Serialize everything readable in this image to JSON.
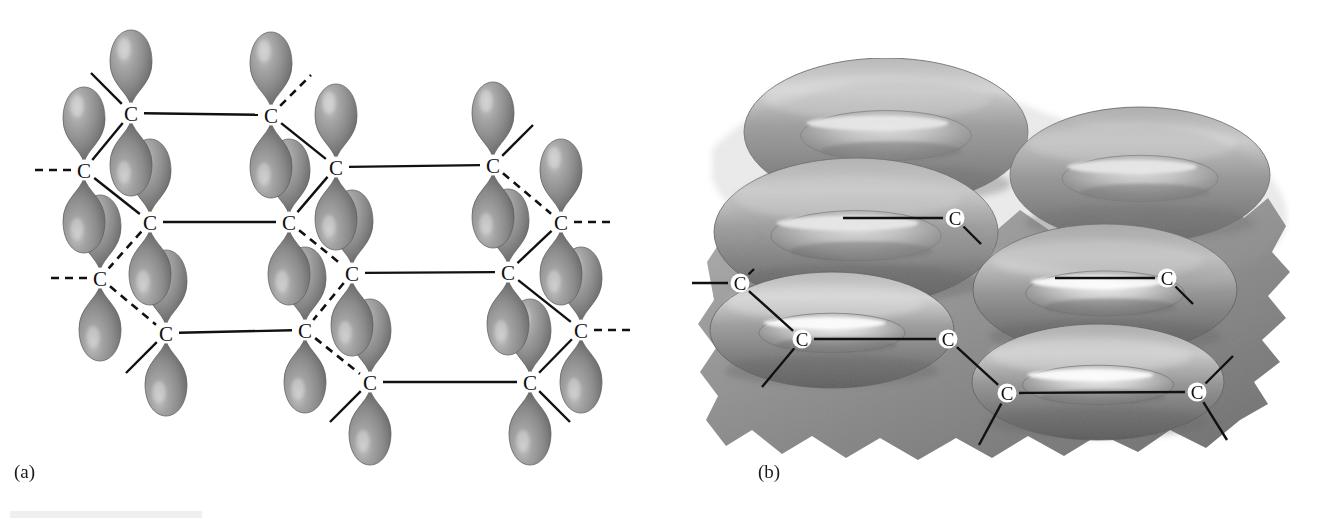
{
  "figure": {
    "kind": "chemistry-structure-diagram",
    "background_color": "#ffffff",
    "ink_color": "#111111",
    "orbital_colors": {
      "highlight": "#c2c2c2",
      "body": "#8d8d8d",
      "shadow": "#5f5f5f",
      "edge": "#4a4a4a"
    },
    "cloud_colors": {
      "highlight": "#e8e8e8",
      "body": "#9a9a9a",
      "shadow": "#6b6b6b",
      "deep": "#565656"
    }
  },
  "panels": [
    {
      "id": "panel-a",
      "label": "(a)",
      "label_x": 14,
      "label_y": 478,
      "description": "Hexagonal carbon sheet with unhybridized p orbitals shown as separate lobes above and below each carbon atom",
      "atom_symbol": "C",
      "atoms": [
        {
          "id": "a1",
          "x": 131,
          "y": 113,
          "lobes": "both"
        },
        {
          "id": "a2",
          "x": 271,
          "y": 115,
          "lobes": "both"
        },
        {
          "id": "a3",
          "x": 84,
          "y": 170,
          "lobes": "both"
        },
        {
          "id": "a4",
          "x": 336,
          "y": 167,
          "lobes": "both"
        },
        {
          "id": "a5",
          "x": 493,
          "y": 165,
          "lobes": "both"
        },
        {
          "id": "a6",
          "x": 150,
          "y": 222,
          "lobes": "both"
        },
        {
          "id": "a7",
          "x": 289,
          "y": 222,
          "lobes": "both"
        },
        {
          "id": "a8",
          "x": 561,
          "y": 222,
          "lobes": "both"
        },
        {
          "id": "a9",
          "x": 100,
          "y": 278,
          "lobes": "both"
        },
        {
          "id": "a10",
          "x": 352,
          "y": 273,
          "lobes": "both"
        },
        {
          "id": "a11",
          "x": 508,
          "y": 272,
          "lobes": "both"
        },
        {
          "id": "a12",
          "x": 166,
          "y": 333,
          "lobes": "both"
        },
        {
          "id": "a13",
          "x": 305,
          "y": 330,
          "lobes": "both"
        },
        {
          "id": "a14",
          "x": 581,
          "y": 330,
          "lobes": "both"
        },
        {
          "id": "a15",
          "x": 370,
          "y": 382,
          "lobes": "both"
        },
        {
          "id": "a16",
          "x": 530,
          "y": 382,
          "lobes": "both"
        }
      ],
      "bonds": [
        {
          "from": "a1",
          "to": "a2",
          "style": "solid"
        },
        {
          "from": "a3",
          "to": "a1",
          "style": "solid"
        },
        {
          "from": "a3",
          "to": "a6",
          "style": "solid"
        },
        {
          "from": "a2",
          "to": "a4",
          "style": "solid"
        },
        {
          "from": "a6",
          "to": "a7",
          "style": "solid"
        },
        {
          "from": "a4",
          "to": "a5",
          "style": "solid"
        },
        {
          "from": "a7",
          "to": "a4",
          "style": "solid"
        },
        {
          "from": "a6",
          "to": "a9",
          "style": "dashed"
        },
        {
          "from": "a9",
          "to": "a12",
          "style": "dashed"
        },
        {
          "from": "a7",
          "to": "a10",
          "style": "dashed"
        },
        {
          "from": "a10",
          "to": "a11",
          "style": "solid"
        },
        {
          "from": "a5",
          "to": "a8",
          "style": "dashed"
        },
        {
          "from": "a8",
          "to": "a11",
          "style": "solid"
        },
        {
          "from": "a12",
          "to": "a13",
          "style": "solid"
        },
        {
          "from": "a10",
          "to": "a13",
          "style": "dashed"
        },
        {
          "from": "a13",
          "to": "a15",
          "style": "dashed"
        },
        {
          "from": "a15",
          "to": "a16",
          "style": "solid"
        },
        {
          "from": "a11",
          "to": "a14",
          "style": "solid"
        },
        {
          "from": "a16",
          "to": "a14",
          "style": "solid"
        }
      ],
      "stub_bonds": [
        {
          "at": "a1",
          "dx": -40,
          "dy": -40,
          "style": "solid"
        },
        {
          "at": "a2",
          "dx": 40,
          "dy": -40,
          "style": "dashed"
        },
        {
          "at": "a3",
          "dx": -52,
          "dy": 0,
          "style": "dashed"
        },
        {
          "at": "a5",
          "dx": 40,
          "dy": -40,
          "style": "solid"
        },
        {
          "at": "a9",
          "dx": -52,
          "dy": 0,
          "style": "dashed"
        },
        {
          "at": "a8",
          "dx": 52,
          "dy": 0,
          "style": "dashed"
        },
        {
          "at": "a12",
          "dx": -40,
          "dy": 40,
          "style": "solid"
        },
        {
          "at": "a14",
          "dx": 52,
          "dy": 0,
          "style": "dashed"
        },
        {
          "at": "a15",
          "dx": -40,
          "dy": 40,
          "style": "solid"
        },
        {
          "at": "a16",
          "dx": 40,
          "dy": 40,
          "style": "solid"
        }
      ]
    },
    {
      "id": "panel-b",
      "label": "(b)",
      "label_x": 758,
      "label_y": 478,
      "description": "Same sheet with the p orbitals merged into continuous doughnut-shaped pi electron clouds above and below the plane of carbon atoms",
      "atom_symbol": "C",
      "atoms": [
        {
          "id": "b1",
          "x": 955,
          "y": 218,
          "context": "embedded-in-cloud"
        },
        {
          "id": "b2",
          "x": 1167,
          "y": 278,
          "context": "embedded-in-cloud"
        },
        {
          "id": "b3",
          "x": 740,
          "y": 283,
          "context": "front-edge"
        },
        {
          "id": "b4",
          "x": 802,
          "y": 339,
          "context": "front-edge"
        },
        {
          "id": "b5",
          "x": 948,
          "y": 339,
          "context": "front-edge"
        },
        {
          "id": "b6",
          "x": 1007,
          "y": 393,
          "context": "front-edge"
        },
        {
          "id": "b7",
          "x": 1197,
          "y": 392,
          "context": "front-edge"
        }
      ],
      "bonds": [
        {
          "from": "b3",
          "to": "b4",
          "style": "solid"
        },
        {
          "from": "b4",
          "to": "b5",
          "style": "solid"
        },
        {
          "from": "b5",
          "to": "b6",
          "style": "solid"
        },
        {
          "from": "b6",
          "to": "b7",
          "style": "solid"
        }
      ],
      "stub_bonds": [
        {
          "at": "b1",
          "dx": -112,
          "dy": 0,
          "style": "solid"
        },
        {
          "at": "b1",
          "dx": 26,
          "dy": 26,
          "style": "solid"
        },
        {
          "at": "b2",
          "dx": -112,
          "dy": 0,
          "style": "solid"
        },
        {
          "at": "b2",
          "dx": 26,
          "dy": 26,
          "style": "solid"
        },
        {
          "at": "b3",
          "dx": -48,
          "dy": 0,
          "style": "solid"
        },
        {
          "at": "b3",
          "dx": 14,
          "dy": -14,
          "style": "solid"
        },
        {
          "at": "b4",
          "dx": -40,
          "dy": 48,
          "style": "solid"
        },
        {
          "at": "b6",
          "dx": -28,
          "dy": 52,
          "style": "solid"
        },
        {
          "at": "b7",
          "dx": 36,
          "dy": -36,
          "style": "solid"
        },
        {
          "at": "b7",
          "dx": 30,
          "dy": 48,
          "style": "solid"
        }
      ],
      "clouds": [
        {
          "id": "ring-upper-left",
          "cx": 886,
          "cy": 132,
          "rx": 142,
          "ry": 74,
          "layer": "top"
        },
        {
          "id": "ring-upper-right",
          "cx": 1140,
          "cy": 175,
          "rx": 130,
          "ry": 68,
          "layer": "top"
        },
        {
          "id": "ring-mid-left",
          "cx": 856,
          "cy": 232,
          "rx": 142,
          "ry": 74,
          "layer": "middle"
        },
        {
          "id": "ring-mid-right",
          "cx": 1105,
          "cy": 290,
          "rx": 132,
          "ry": 66,
          "layer": "middle"
        },
        {
          "id": "ring-lower-left",
          "cx": 832,
          "cy": 330,
          "rx": 122,
          "ry": 58,
          "layer": "bottom"
        },
        {
          "id": "ring-lower-right",
          "cx": 1098,
          "cy": 382,
          "rx": 126,
          "ry": 58,
          "layer": "bottom"
        }
      ]
    }
  ],
  "artifacts": [
    {
      "id": "scan-strip",
      "x": 10,
      "y": 511,
      "width": 192,
      "height": 7,
      "color": "#efefef"
    }
  ]
}
